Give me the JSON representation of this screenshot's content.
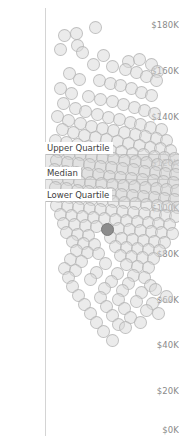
{
  "chart_data": {
    "type": "scatter",
    "title": "",
    "xlabel": "",
    "ylabel": "",
    "ylim": [
      0,
      190000
    ],
    "y_tick_labels": [
      "$180K",
      "$160K",
      "$140K",
      "$120K",
      "$100K",
      "$80K",
      "$60K",
      "$40K",
      "$20K",
      "$0K"
    ],
    "y_tick_values": [
      180000,
      160000,
      140000,
      120000,
      100000,
      80000,
      60000,
      40000,
      20000,
      0
    ],
    "grid": false,
    "legend": "none",
    "jitter": true,
    "marker": {
      "shape": "circle",
      "fill": "#d8d8d8",
      "stroke": "#b0b0b0",
      "opacity": 0.5,
      "size_px": 13
    },
    "highlight_marker": {
      "fill": "#8c8c8c",
      "stroke": "#7a7a7a",
      "value": 94000
    },
    "reference_lines": [
      {
        "name": "Upper Quartile",
        "label": "Upper Quartile",
        "value": 123000,
        "color": "#bdbdbd"
      },
      {
        "name": "Median",
        "label": "Median",
        "value": 112000,
        "color": "#bdbdbd"
      },
      {
        "name": "Lower Quartile",
        "label": "Lower Quartile",
        "value": 102000,
        "color": "#bdbdbd"
      }
    ],
    "reference_band": {
      "from": 102000,
      "to": 123000,
      "fill": "#d9d9d9",
      "opacity": 0.55
    },
    "points": [
      [
        95,
        27
      ],
      [
        64,
        35
      ],
      [
        76,
        33
      ],
      [
        77,
        45
      ],
      [
        60,
        49
      ],
      [
        82,
        52
      ],
      [
        128,
        61
      ],
      [
        139,
        59
      ],
      [
        151,
        64
      ],
      [
        157,
        71
      ],
      [
        103,
        55
      ],
      [
        93,
        64
      ],
      [
        112,
        66
      ],
      [
        125,
        69
      ],
      [
        136,
        72
      ],
      [
        146,
        76
      ],
      [
        156,
        80
      ],
      [
        69,
        73
      ],
      [
        79,
        79
      ],
      [
        99,
        80
      ],
      [
        110,
        83
      ],
      [
        120,
        85
      ],
      [
        131,
        88
      ],
      [
        141,
        92
      ],
      [
        151,
        95
      ],
      [
        60,
        88
      ],
      [
        71,
        93
      ],
      [
        88,
        96
      ],
      [
        100,
        99
      ],
      [
        112,
        101
      ],
      [
        123,
        104
      ],
      [
        134,
        107
      ],
      [
        144,
        110
      ],
      [
        154,
        113
      ],
      [
        63,
        103
      ],
      [
        75,
        108
      ],
      [
        85,
        111
      ],
      [
        97,
        114
      ],
      [
        108,
        117
      ],
      [
        119,
        119
      ],
      [
        130,
        122
      ],
      [
        140,
        124
      ],
      [
        150,
        127
      ],
      [
        161,
        129
      ],
      [
        57,
        116
      ],
      [
        68,
        120
      ],
      [
        80,
        123
      ],
      [
        91,
        126
      ],
      [
        102,
        128
      ],
      [
        113,
        130
      ],
      [
        124,
        132
      ],
      [
        135,
        134
      ],
      [
        145,
        136
      ],
      [
        156,
        138
      ],
      [
        166,
        140
      ],
      [
        62,
        129
      ],
      [
        73,
        132
      ],
      [
        84,
        135
      ],
      [
        95,
        137
      ],
      [
        106,
        139
      ],
      [
        117,
        141
      ],
      [
        128,
        143
      ],
      [
        139,
        145
      ],
      [
        150,
        147
      ],
      [
        160,
        148
      ],
      [
        170,
        150
      ],
      [
        55,
        140
      ],
      [
        66,
        142
      ],
      [
        77,
        144
      ],
      [
        88,
        146
      ],
      [
        99,
        148
      ],
      [
        110,
        150
      ],
      [
        121,
        151
      ],
      [
        132,
        153
      ],
      [
        143,
        154
      ],
      [
        154,
        156
      ],
      [
        164,
        157
      ],
      [
        174,
        158
      ],
      [
        58,
        151
      ],
      [
        69,
        153
      ],
      [
        80,
        154
      ],
      [
        91,
        156
      ],
      [
        102,
        157
      ],
      [
        113,
        158
      ],
      [
        124,
        160
      ],
      [
        135,
        161
      ],
      [
        146,
        162
      ],
      [
        157,
        164
      ],
      [
        167,
        165
      ],
      [
        177,
        166
      ],
      [
        56,
        160
      ],
      [
        67,
        162
      ],
      [
        78,
        163
      ],
      [
        89,
        164
      ],
      [
        100,
        166
      ],
      [
        111,
        167
      ],
      [
        122,
        168
      ],
      [
        133,
        169
      ],
      [
        144,
        171
      ],
      [
        155,
        172
      ],
      [
        165,
        173
      ],
      [
        175,
        174
      ],
      [
        54,
        169
      ],
      [
        65,
        171
      ],
      [
        76,
        172
      ],
      [
        87,
        173
      ],
      [
        98,
        174
      ],
      [
        109,
        176
      ],
      [
        120,
        177
      ],
      [
        131,
        178
      ],
      [
        142,
        179
      ],
      [
        153,
        180
      ],
      [
        163,
        181
      ],
      [
        173,
        182
      ],
      [
        57,
        178
      ],
      [
        68,
        179
      ],
      [
        79,
        181
      ],
      [
        90,
        182
      ],
      [
        101,
        183
      ],
      [
        112,
        184
      ],
      [
        123,
        185
      ],
      [
        134,
        186
      ],
      [
        145,
        187
      ],
      [
        156,
        188
      ],
      [
        166,
        189
      ],
      [
        176,
        190
      ],
      [
        55,
        187
      ],
      [
        66,
        188
      ],
      [
        77,
        190
      ],
      [
        88,
        191
      ],
      [
        99,
        192
      ],
      [
        110,
        193
      ],
      [
        121,
        194
      ],
      [
        132,
        195
      ],
      [
        143,
        196
      ],
      [
        154,
        197
      ],
      [
        164,
        198
      ],
      [
        174,
        199
      ],
      [
        58,
        196
      ],
      [
        69,
        197
      ],
      [
        80,
        198
      ],
      [
        91,
        199
      ],
      [
        102,
        200
      ],
      [
        113,
        201
      ],
      [
        124,
        202
      ],
      [
        135,
        203
      ],
      [
        146,
        204
      ],
      [
        157,
        205
      ],
      [
        167,
        206
      ],
      [
        177,
        207
      ],
      [
        56,
        205
      ],
      [
        67,
        206
      ],
      [
        78,
        207
      ],
      [
        89,
        208
      ],
      [
        100,
        209
      ],
      [
        111,
        210
      ],
      [
        122,
        211
      ],
      [
        133,
        212
      ],
      [
        144,
        213
      ],
      [
        155,
        214
      ],
      [
        165,
        215
      ],
      [
        175,
        216
      ],
      [
        60,
        214
      ],
      [
        71,
        215
      ],
      [
        82,
        216
      ],
      [
        93,
        217
      ],
      [
        104,
        218
      ],
      [
        115,
        219
      ],
      [
        126,
        220
      ],
      [
        137,
        221
      ],
      [
        148,
        222
      ],
      [
        158,
        223
      ],
      [
        169,
        224
      ],
      [
        63,
        223
      ],
      [
        74,
        224
      ],
      [
        85,
        225
      ],
      [
        96,
        226
      ],
      [
        118,
        228
      ],
      [
        129,
        229
      ],
      [
        140,
        230
      ],
      [
        151,
        231
      ],
      [
        161,
        232
      ],
      [
        172,
        233
      ],
      [
        66,
        232
      ],
      [
        77,
        234
      ],
      [
        88,
        235
      ],
      [
        110,
        237
      ],
      [
        121,
        238
      ],
      [
        132,
        239
      ],
      [
        143,
        240
      ],
      [
        154,
        241
      ],
      [
        164,
        242
      ],
      [
        72,
        241
      ],
      [
        83,
        243
      ],
      [
        94,
        244
      ],
      [
        115,
        246
      ],
      [
        126,
        247
      ],
      [
        137,
        248
      ],
      [
        148,
        249
      ],
      [
        159,
        250
      ],
      [
        76,
        250
      ],
      [
        87,
        252
      ],
      [
        98,
        253
      ],
      [
        120,
        255
      ],
      [
        131,
        256
      ],
      [
        142,
        257
      ],
      [
        153,
        258
      ],
      [
        70,
        259
      ],
      [
        81,
        261
      ],
      [
        105,
        263
      ],
      [
        126,
        264
      ],
      [
        137,
        266
      ],
      [
        148,
        267
      ],
      [
        64,
        268
      ],
      [
        75,
        270
      ],
      [
        96,
        272
      ],
      [
        117,
        273
      ],
      [
        133,
        275
      ],
      [
        144,
        277
      ],
      [
        68,
        277
      ],
      [
        90,
        279
      ],
      [
        111,
        281
      ],
      [
        128,
        283
      ],
      [
        150,
        285
      ],
      [
        72,
        286
      ],
      [
        104,
        288
      ],
      [
        122,
        290
      ],
      [
        141,
        292
      ],
      [
        155,
        289
      ],
      [
        78,
        295
      ],
      [
        100,
        297
      ],
      [
        118,
        299
      ],
      [
        136,
        301
      ],
      [
        152,
        303
      ],
      [
        166,
        296
      ],
      [
        84,
        304
      ],
      [
        106,
        306
      ],
      [
        124,
        308
      ],
      [
        146,
        310
      ],
      [
        90,
        313
      ],
      [
        112,
        315
      ],
      [
        130,
        317
      ],
      [
        158,
        313
      ],
      [
        96,
        322
      ],
      [
        118,
        324
      ],
      [
        140,
        322
      ],
      [
        103,
        331
      ],
      [
        125,
        327
      ],
      [
        112,
        340
      ]
    ],
    "highlight_point": [
      107,
      229
    ]
  },
  "axis": {
    "ticks": [
      {
        "label": "$180K",
        "top": 21
      },
      {
        "label": "$160K",
        "top": 67
      },
      {
        "label": "$140K",
        "top": 113
      },
      {
        "label": "$120K",
        "top": 159
      },
      {
        "label": "$100K",
        "top": 204
      },
      {
        "label": "$80K",
        "top": 250
      },
      {
        "label": "$60K",
        "top": 296
      },
      {
        "label": "$40K",
        "top": 341
      },
      {
        "label": "$20K",
        "top": 387
      },
      {
        "label": "$0K",
        "top": 426
      }
    ]
  },
  "annotations": {
    "upper_quartile": "Upper Quartile",
    "median": "Median",
    "lower_quartile": "Lower Quartile"
  }
}
